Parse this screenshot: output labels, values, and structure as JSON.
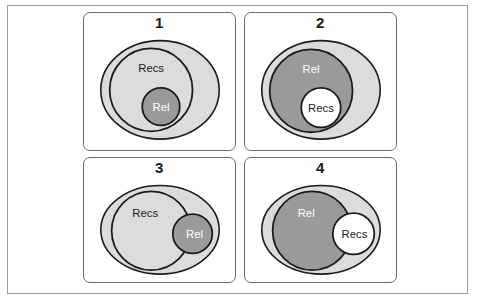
{
  "figure": {
    "title": "",
    "panel_count": 4,
    "colors": {
      "universe_fill": "#dcdcdc",
      "dark_set_fill": "#9a9a9a",
      "light_set_fill": "#dcdcdc",
      "white_fill": "#ffffff",
      "stroke": "#1a1a1a",
      "panel_border": "#6b6b6b",
      "frame_border": "#9e9e9e",
      "label_dark_text": "#1c1c1c",
      "label_light_text": "#ffffff"
    }
  },
  "panels": [
    {
      "number": "1",
      "name": "panel-1",
      "description": "Rel fully contained inside Recs, both inside the universe ellipse",
      "sets": [
        {
          "key": "recs",
          "label": "Recs",
          "shade": "light",
          "text_color": "dark"
        },
        {
          "key": "rel",
          "label": "Rel",
          "shade": "dark",
          "text_color": "light"
        }
      ],
      "universe_label": ""
    },
    {
      "number": "2",
      "name": "panel-2",
      "description": "Recs fully contained inside Rel, both inside the universe ellipse",
      "sets": [
        {
          "key": "rel",
          "label": "Rel",
          "shade": "dark",
          "text_color": "light"
        },
        {
          "key": "recs",
          "label": "Recs",
          "shade": "white",
          "text_color": "dark"
        }
      ],
      "universe_label": ""
    },
    {
      "number": "3",
      "name": "panel-3",
      "description": "Large Recs circle and small Rel circle partially overlapping, inside the universe ellipse",
      "sets": [
        {
          "key": "recs",
          "label": "Recs",
          "shade": "light",
          "text_color": "dark"
        },
        {
          "key": "rel",
          "label": "Rel",
          "shade": "dark",
          "text_color": "light"
        }
      ],
      "universe_label": ""
    },
    {
      "number": "4",
      "name": "panel-4",
      "description": "Large Rel circle and small Recs circle partially overlapping, inside the universe ellipse",
      "sets": [
        {
          "key": "rel",
          "label": "Rel",
          "shade": "dark",
          "text_color": "light"
        },
        {
          "key": "recs",
          "label": "Recs",
          "shade": "white",
          "text_color": "dark"
        }
      ],
      "universe_label": ""
    }
  ],
  "labels": {
    "recs": "Recs",
    "rel": "Rel"
  }
}
